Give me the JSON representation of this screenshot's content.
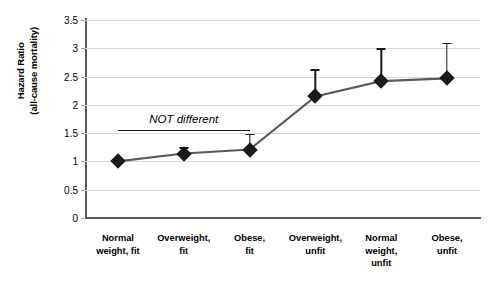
{
  "chart_data": {
    "type": "line",
    "title": "",
    "xlabel": "",
    "ylabel": "Hazard Ratio (all-cause mortality)",
    "ylabel_line1": "Hazard Ratio",
    "ylabel_line2": "(all-cause mortality)",
    "ylim": [
      0,
      3.5
    ],
    "ytick_labels": [
      "0",
      "0.5",
      "1",
      "1.5",
      "2",
      "2.5",
      "3",
      "3.5"
    ],
    "ytick_values": [
      0,
      0.5,
      1,
      1.5,
      2,
      2.5,
      3,
      3.5
    ],
    "grid": true,
    "legend": "none",
    "categories": [
      "Normal weight, fit",
      "Overweight, fit",
      "Obese, fit",
      "Overweight, unfit",
      "Normal weight, unfit",
      "Obese, unfit"
    ],
    "category_lines": [
      [
        "Normal",
        "weight, fit"
      ],
      [
        "Overweight,",
        "fit"
      ],
      [
        "Obese,",
        "fit"
      ],
      [
        "Overweight,",
        "unfit"
      ],
      [
        "Normal",
        "weight,",
        "unfit"
      ],
      [
        "Obese,",
        "unfit"
      ]
    ],
    "values": [
      1.0,
      1.14,
      1.21,
      2.15,
      2.42,
      2.47
    ],
    "error_upper": [
      1.0,
      1.25,
      1.49,
      2.63,
      3.0,
      3.1
    ],
    "error_lower": [
      1.0,
      1.14,
      1.21,
      2.15,
      2.42,
      2.47
    ],
    "series": [
      {
        "name": "Hazard ratio",
        "values": [
          1.0,
          1.14,
          1.21,
          2.15,
          2.42,
          2.47
        ],
        "marker": "diamond",
        "color": "#1a1a1a"
      }
    ],
    "annotations": [
      {
        "text": "NOT different",
        "x_start_category": "Normal weight, fit",
        "x_end_category": "Obese, fit",
        "style": "italic-with-underline"
      }
    ]
  },
  "colors": {
    "marker": "#1a1a1a",
    "line": "#595959",
    "gridline": "#d9d9d9",
    "axis": "#595959",
    "background": "#ffffff"
  }
}
